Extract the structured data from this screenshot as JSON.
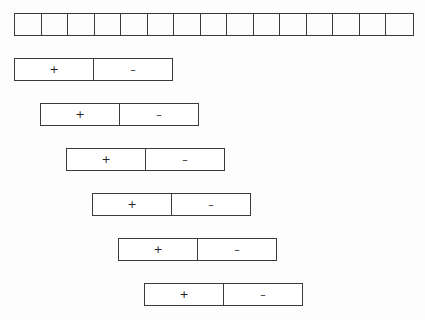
{
  "diagram": {
    "cell_row": {
      "count": 15,
      "stroke_color": "#3a3a3a"
    },
    "boxes": [
      {
        "plus_label": "+",
        "minus_label": "–"
      },
      {
        "plus_label": "+",
        "minus_label": "–"
      },
      {
        "plus_label": "+",
        "minus_label": "–"
      },
      {
        "plus_label": "+",
        "minus_label": "–"
      },
      {
        "plus_label": "+",
        "minus_label": "–"
      },
      {
        "plus_label": "+",
        "minus_label": "–"
      }
    ],
    "colors": {
      "background": "#fdfdfd",
      "stroke": "#3a3a3a",
      "text": "#222222"
    }
  }
}
